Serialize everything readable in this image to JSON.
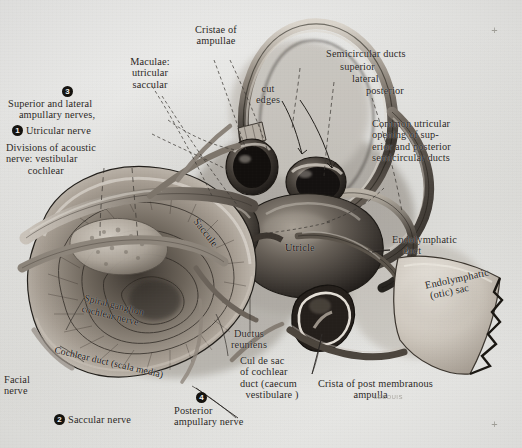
{
  "plate": {
    "title": "Membranous labyrinth of the inner ear",
    "medium": "halftone anatomical drawing on gray paper",
    "signature": "LEBOUIS",
    "registration_marks": [
      "+",
      "+"
    ]
  },
  "markers": [
    {
      "n": "1",
      "for": "Utricular nerve"
    },
    {
      "n": "2",
      "for": "Saccular nerve"
    },
    {
      "n": "3",
      "for": "Superior and lateral ampullary nerves"
    },
    {
      "n": "4",
      "for": "Posterior ampullary nerve"
    }
  ],
  "labels": {
    "cristae_of_ampullae": {
      "text": "Cristae of\nampullae"
    },
    "maculae": {
      "text": "Maculae:\nutricular\nsaccular"
    },
    "superior_lateral_amp": {
      "text": "Superior and lateral\n    ampullary nerves,"
    },
    "utricular_nerve": {
      "text": "Utricular nerve"
    },
    "divisions_acoustic": {
      "text": "Divisions of acoustic\nnerve: vestibular\n        cochlear"
    },
    "cut_edges": {
      "text": "cut\nedges"
    },
    "semicircular_ducts": {
      "text": "Semicircular ducts"
    },
    "sc_superior": {
      "text": "superior"
    },
    "sc_lateral": {
      "text": "lateral"
    },
    "sc_posterior": {
      "text": "posterior"
    },
    "common_utricular": {
      "text": "Common utricular\nopening of sup-\nerior and posterior\nsemicircular ducts"
    },
    "endolymphatic_duct": {
      "text": "Endolymphatic\n    duct"
    },
    "endolymphatic_sac": {
      "text": "Endolymphatic\n (otic) sac"
    },
    "saccule": {
      "text": "Saccule"
    },
    "utricle": {
      "text": "Utricle"
    },
    "spiral_ganglion": {
      "text": "Spiral ganglion\ncochlear nerve"
    },
    "cochlear_duct": {
      "text": "Cochlear duct (scala media)"
    },
    "facial_nerve": {
      "text": "Facial\nnerve"
    },
    "saccular_nerve": {
      "text": "Saccular nerve"
    },
    "ductus_reuniens": {
      "text": "Ductus\nreuniens"
    },
    "cul_de_sac": {
      "text": "Cul de sac\nof cochlear\nduct (caecum\n  vestibulare )"
    },
    "posterior_amp_nerve": {
      "text": "Posterior\nampullary nerve"
    },
    "crista_post": {
      "text": "Crista of post membranous\n             ampulla"
    }
  },
  "colors": {
    "paper": "#eaeae8",
    "ink": "#2a2724",
    "specimen_dark": "#2f2b27",
    "specimen_mid": "#6d665e",
    "specimen_light": "#cfc9c0",
    "marker_fill": "#15130f",
    "marker_text": "#f2f1ee"
  }
}
